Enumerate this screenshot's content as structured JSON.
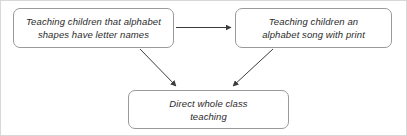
{
  "diagram": {
    "type": "flowchart",
    "orientation": "top-down",
    "canvas": {
      "width": 407,
      "height": 136,
      "background": "#ffffff"
    },
    "style": {
      "box_border_color": "#9a9a9a",
      "box_fill_color": "#ffffff",
      "text_color": "#2b2b2b",
      "connector_color": "#3c3c3c",
      "frame_color": "#d8d8d8",
      "font_style": "italic",
      "corner_radius_px": 7
    },
    "nodes": [
      {
        "id": "alphabet-shapes",
        "label": "Teaching children that alphabet\nshapes have letter names",
        "lines": [
          "Teaching children that alphabet",
          "shapes have letter names"
        ],
        "position": "top-left"
      },
      {
        "id": "alphabet-song",
        "label": "Teaching children an\nalphabet song with print",
        "lines": [
          "Teaching children an",
          "alphabet song with print"
        ],
        "position": "top-right"
      },
      {
        "id": "direct-teaching",
        "label": "Direct whole class\nteaching",
        "lines": [
          "Direct whole class",
          "teaching"
        ],
        "position": "bottom-center"
      }
    ],
    "connectors": [
      {
        "id": "shapes-to-song",
        "from": "alphabet-shapes",
        "to": "alphabet-song",
        "direction": "horizontal-right",
        "arrowhead": "filled-triangle",
        "label": ""
      },
      {
        "id": "shapes-to-direct",
        "from": "alphabet-shapes",
        "to": "direct-teaching",
        "direction": "diagonal-down-right",
        "arrowhead": "filled-triangle",
        "label": ""
      },
      {
        "id": "song-to-direct",
        "from": "alphabet-song",
        "to": "direct-teaching",
        "direction": "diagonal-down-left",
        "arrowhead": "filled-triangle",
        "label": ""
      }
    ]
  }
}
